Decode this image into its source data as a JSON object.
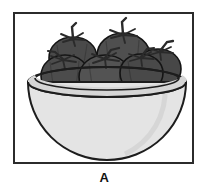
{
  "figure": {
    "label": "A",
    "panel_letter": "A",
    "frame": {
      "border_color": "#2b2b2b",
      "background": "#ffffff",
      "border_width_px": 2,
      "x": 13,
      "y": 12,
      "width": 181,
      "height": 152
    },
    "illustration": {
      "type": "line-art-grayscale",
      "subject": "bowl-of-tomatoes",
      "object_count": 6,
      "bowl": {
        "name": "hemispherical-bowl",
        "fill_color": "#e3e3e3",
        "rim_fill_color": "#d2d2d2",
        "interior_shadow_color": "#bfbfbf",
        "outline_color": "#1d1d1d",
        "rim_center_x": 92,
        "rim_center_y": 68,
        "rim_radius_x": 79,
        "rim_radius_y": 15,
        "bottom_y": 144
      },
      "fruit": {
        "name": "tomato",
        "fill_color": "#4d4d4d",
        "shade_color": "#3a3a3a",
        "highlight_color": "#5e5e5e",
        "outline_color": "#111111",
        "stem_color": "#2a2a2a",
        "items": [
          {
            "id": "tomato-back-left",
            "cx": 58,
            "cy": 45,
            "rx": 25,
            "ry": 22,
            "stem": "up-left"
          },
          {
            "id": "tomato-back-right",
            "cx": 108,
            "cy": 42,
            "rx": 27,
            "ry": 23,
            "stem": "up"
          },
          {
            "id": "tomato-mid-right",
            "cx": 143,
            "cy": 57,
            "rx": 23,
            "ry": 20,
            "stem": "right"
          },
          {
            "id": "tomato-front-left",
            "cx": 50,
            "cy": 63,
            "rx": 24,
            "ry": 21,
            "stem": "star-left"
          },
          {
            "id": "tomato-front-mid",
            "cx": 90,
            "cy": 64,
            "rx": 26,
            "ry": 22,
            "stem": "star-center"
          },
          {
            "id": "tomato-front-right",
            "cx": 126,
            "cy": 60,
            "rx": 22,
            "ry": 19,
            "stem": "star-right"
          }
        ]
      }
    }
  }
}
